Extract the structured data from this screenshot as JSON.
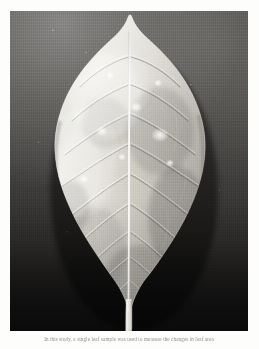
{
  "page": {
    "background_color": "#fdfdfc",
    "kind": "photographic-plate"
  },
  "plate": {
    "subject": "single broad leaf specimen, adaxial surface, photographed against a graduated dark studio backdrop",
    "orientation": "apex at top, petiole at bottom",
    "backdrop_colors": {
      "top": "#575552",
      "middle": "#3a3836",
      "bottom": "#0b0a0a"
    },
    "leaf_colors": {
      "highlight": "#f2f0ea",
      "midtone": "#c9c6bd",
      "shadow": "#8e8b83",
      "deep_shadow": "#6a6761",
      "midrib": "#f7f6f2"
    },
    "features": {
      "midrib_label": "midrib",
      "margin_label": "undulate margin",
      "apex_label": "acuminate apex",
      "petiole_label": "petiole",
      "lesion_label": "pale lesion spot",
      "lesion_count": 7,
      "vein_pairs": 9
    }
  },
  "caption": {
    "text": "In this study, a single leaf sample was used to measure the changes in leaf area"
  }
}
